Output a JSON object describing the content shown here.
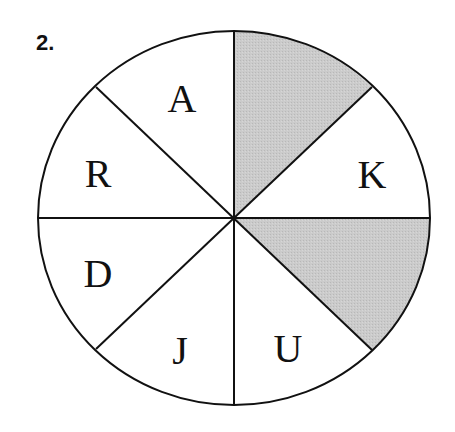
{
  "question": {
    "number": "2."
  },
  "diagram": {
    "type": "circle divided into 8 equal sectors",
    "colors": {
      "stroke": "#111111",
      "shade": "#c8c8c8",
      "background": "#ffffff"
    },
    "segments": [
      {
        "position": "top-right",
        "letter": "",
        "shaded": true
      },
      {
        "position": "right-upper",
        "letter": "K",
        "shaded": false
      },
      {
        "position": "right-lower",
        "letter": "",
        "shaded": true
      },
      {
        "position": "bottom-right",
        "letter": "U",
        "shaded": false
      },
      {
        "position": "bottom-left",
        "letter": "J",
        "shaded": false
      },
      {
        "position": "left-lower",
        "letter": "D",
        "shaded": false
      },
      {
        "position": "left-upper",
        "letter": "R",
        "shaded": false
      },
      {
        "position": "top-left",
        "letter": "A",
        "shaded": false
      }
    ]
  }
}
